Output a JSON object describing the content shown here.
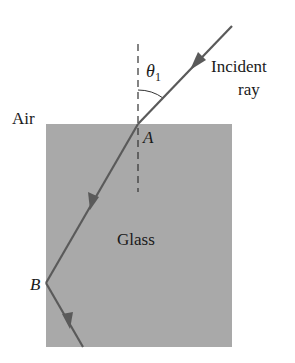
{
  "diagram": {
    "type": "refraction-reflection",
    "labels": {
      "air": "Air",
      "glass": "Glass",
      "point_a": "A",
      "point_b": "B",
      "incident_line1": "Incident",
      "incident_line2": "ray",
      "theta": "θ",
      "theta_sub": "1"
    },
    "colors": {
      "glass_fill": "#a9a9a9",
      "ray": "#5a5a5a",
      "normal": "#333333",
      "text": "#1a1a1a",
      "background": "#ffffff"
    }
  }
}
